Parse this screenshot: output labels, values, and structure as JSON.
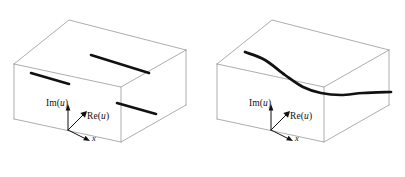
{
  "figure": {
    "width": 405,
    "height": 177,
    "background_color": "#ffffff",
    "box_edge_color": "#8a8a8a",
    "solution_color": "#111111"
  },
  "panels": [
    {
      "id": "left",
      "name": "real-solution-panel",
      "axes": {
        "vertical": {
          "label_prefix": "Im",
          "label_arg": "u",
          "label_text": "Im(u)"
        },
        "diagonal": {
          "label_prefix": "Re",
          "label_arg": "u",
          "label_text": "Re(u)"
        },
        "horizontal": {
          "label_text": "x"
        }
      },
      "solutions": {
        "type": "segments",
        "count": 3,
        "items": [
          {
            "name": "segment-left",
            "x1": 31,
            "y1": 73,
            "x2": 69,
            "y2": 84
          },
          {
            "name": "segment-top",
            "x1": 91,
            "y1": 55,
            "x2": 149,
            "y2": 73
          },
          {
            "name": "segment-front",
            "x1": 117,
            "y1": 103,
            "x2": 156,
            "y2": 114
          }
        ]
      }
    },
    {
      "id": "right",
      "name": "complex-solution-panel",
      "axes": {
        "vertical": {
          "label_prefix": "Im",
          "label_arg": "u",
          "label_text": "Im(u)"
        },
        "diagonal": {
          "label_prefix": "Re",
          "label_arg": "u",
          "label_text": "Re(u)"
        },
        "horizontal": {
          "label_text": "x"
        }
      },
      "solutions": {
        "type": "curve",
        "count": 1,
        "items": [
          {
            "name": "s-curve",
            "start": [
              42,
              52
            ],
            "end": [
              188,
              92
            ]
          }
        ]
      }
    }
  ],
  "chart_data": {
    "type": "line",
    "title": "",
    "xlabel": "x",
    "ylabel": "Im(u)",
    "zlabel": "Re(u)",
    "panels": [
      {
        "panel": "left",
        "description": "three straight solution segments inside perspective box",
        "series": [
          {
            "name": "segment-left",
            "x": [
              31,
              69
            ],
            "y": [
              73,
              84
            ]
          },
          {
            "name": "segment-top",
            "x": [
              91,
              149
            ],
            "y": [
              55,
              73
            ]
          },
          {
            "name": "segment-front",
            "x": [
              117,
              156
            ],
            "y": [
              103,
              114
            ]
          }
        ]
      },
      {
        "panel": "right",
        "description": "single smooth S-shaped solution curve inside perspective box",
        "series": [
          {
            "name": "s-curve",
            "x": [
              42,
              62,
              82,
              100,
              118,
              138,
              160,
              188
            ],
            "y": [
              52,
              60,
              75,
              87,
              93,
              95,
              93,
              92
            ]
          }
        ]
      }
    ]
  }
}
